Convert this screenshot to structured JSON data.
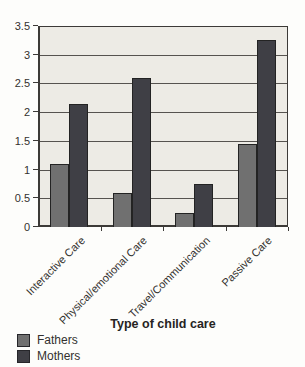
{
  "chart_data": {
    "type": "bar",
    "title": "",
    "xlabel": "Type of child care",
    "ylabel": "",
    "categories": [
      "Interactive Care",
      "Physical/emotional Care",
      "Travel/Communication",
      "Passive Care"
    ],
    "series": [
      {
        "name": "Fathers",
        "color": "#707070",
        "values": [
          1.1,
          0.6,
          0.25,
          1.45
        ]
      },
      {
        "name": "Mothers",
        "color": "#3f3f45",
        "values": [
          2.15,
          2.6,
          0.75,
          3.25
        ]
      }
    ],
    "ylim": [
      0,
      3.5
    ],
    "ytick_step": 0.5,
    "yticks": [
      "0",
      "0.5",
      "1",
      "1.5",
      "2",
      "2.5",
      "3",
      "3.5"
    ],
    "grid": true,
    "legend_position": "bottom-left",
    "colors": {
      "plot_background": "#edebe5",
      "gridline": "#56534f",
      "axis": "#3c3a37",
      "text": "#33312e"
    }
  }
}
